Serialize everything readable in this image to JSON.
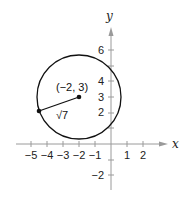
{
  "diagram": {
    "type": "circle-on-coordinate-plane",
    "axes": {
      "x_label": "x",
      "y_label": "y",
      "x_ticks": [
        {
          "value": -5,
          "label": "−5"
        },
        {
          "value": -4,
          "label": "−4"
        },
        {
          "value": -3,
          "label": "−3"
        },
        {
          "value": -2,
          "label": "−2"
        },
        {
          "value": -1,
          "label": "−1"
        },
        {
          "value": 1,
          "label": "1"
        },
        {
          "value": 2,
          "label": "2"
        }
      ],
      "y_ticks": [
        {
          "value": 6,
          "label": "6"
        },
        {
          "value": 4,
          "label": "4"
        },
        {
          "value": 3,
          "label": "3"
        },
        {
          "value": 2,
          "label": "2"
        },
        {
          "value": -2,
          "label": "−2"
        }
      ]
    },
    "circle": {
      "center": [
        -2,
        3
      ],
      "radius_label": "√7",
      "center_label": "(−2, 3)"
    },
    "colors": {
      "stroke": "#111111",
      "axis": "#9a9a9a"
    }
  }
}
